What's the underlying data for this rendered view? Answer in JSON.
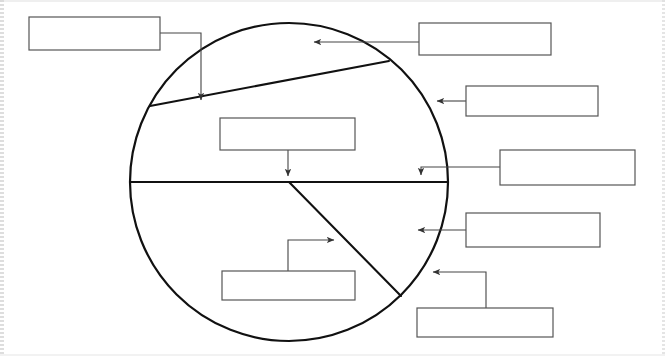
{
  "document": {
    "kind": "worksheet-diagram",
    "title": "",
    "background_color": "#ffffff",
    "ink_color": "#1a1a1a",
    "box_border_color": "#555555",
    "leader_color": "#444444"
  },
  "diagram": {
    "name": "labelled-circle-diagram",
    "shape": "circle",
    "center_x": 289,
    "center_y": 182,
    "radius": 159,
    "outline_color": "#111111",
    "outline_width": 2.2,
    "fill": "none",
    "dividers": [
      {
        "name": "horizontal-diameter",
        "x1": 130,
        "y1": 182,
        "x2": 448,
        "y2": 182
      },
      {
        "name": "upper-chord",
        "x1": 150,
        "y1": 106,
        "x2": 389,
        "y2": 61
      },
      {
        "name": "lower-right-radius",
        "x1": 289,
        "y1": 182,
        "x2": 401,
        "y2": 296
      }
    ]
  },
  "answer_boxes": [
    {
      "name": "answer-box-top-left",
      "value": "",
      "placeholder": "",
      "x": 29,
      "y": 17,
      "width": 131,
      "height": 33
    },
    {
      "name": "answer-box-upper-interior",
      "value": "",
      "placeholder": "",
      "x": 220,
      "y": 118,
      "width": 135,
      "height": 32
    },
    {
      "name": "answer-box-top-right",
      "value": "",
      "placeholder": "",
      "x": 419,
      "y": 23,
      "width": 132,
      "height": 32
    },
    {
      "name": "answer-box-right-upper",
      "value": "",
      "placeholder": "",
      "x": 466,
      "y": 86,
      "width": 132,
      "height": 30
    },
    {
      "name": "answer-box-right-middle",
      "value": "",
      "placeholder": "",
      "x": 500,
      "y": 150,
      "width": 135,
      "height": 35
    },
    {
      "name": "answer-box-right-lower",
      "value": "",
      "placeholder": "",
      "x": 466,
      "y": 213,
      "width": 134,
      "height": 34
    },
    {
      "name": "answer-box-lower-interior",
      "value": "",
      "placeholder": "",
      "x": 222,
      "y": 271,
      "width": 133,
      "height": 29
    },
    {
      "name": "answer-box-bottom-right",
      "value": "",
      "placeholder": "",
      "x": 417,
      "y": 308,
      "width": 136,
      "height": 29
    }
  ],
  "leader_lines": [
    {
      "name": "leader-top-left",
      "path": "M 160 33 L 201 33 L 201 100",
      "arrow_at": {
        "x": 201,
        "y": 106,
        "direction": "down"
      }
    },
    {
      "name": "leader-upper-interior",
      "path": "M 288 150 L 288 176",
      "arrow_at": {
        "x": 288,
        "y": 182,
        "direction": "down"
      }
    },
    {
      "name": "leader-top-right",
      "path": "M 419 42 L 314 42",
      "arrow_at": {
        "x": 307,
        "y": 42,
        "direction": "left"
      }
    },
    {
      "name": "leader-right-upper",
      "path": "M 466 101 L 437 101",
      "arrow_at": {
        "x": 430,
        "y": 101,
        "direction": "left"
      }
    },
    {
      "name": "leader-right-middle",
      "path": "M 500 167 L 421 167 L 421 175",
      "arrow_at": {
        "x": 421,
        "y": 181,
        "direction": "down"
      }
    },
    {
      "name": "leader-right-lower",
      "path": "M 466 230 L 418 230",
      "arrow_at": {
        "x": 411,
        "y": 230,
        "direction": "left"
      }
    },
    {
      "name": "leader-lower-interior",
      "path": "M 288 271 L 288 240 L 334 240",
      "arrow_at": {
        "x": 341,
        "y": 240,
        "direction": "right"
      }
    },
    {
      "name": "leader-bottom-right",
      "path": "M 486 308 L 486 272 L 433 272",
      "arrow_at": {
        "x": 426,
        "y": 272,
        "direction": "left"
      }
    }
  ]
}
